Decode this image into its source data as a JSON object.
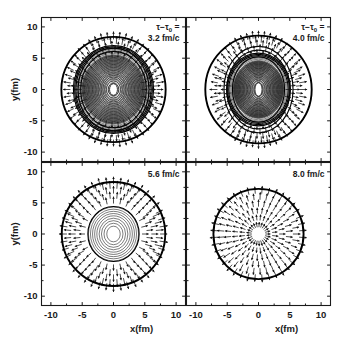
{
  "figure": {
    "width": 347,
    "height": 349,
    "background": "#ffffff",
    "foreground": "#111111"
  },
  "axes": {
    "x_title": "x(fm)",
    "y_title": "y(fm)",
    "x_ticks": [
      "-10",
      "-5",
      "0",
      "5",
      "10"
    ],
    "y_ticks": [
      "10",
      "5",
      "0",
      "-5",
      "-10"
    ],
    "x_tick_values": [
      -10,
      -5,
      0,
      5,
      10
    ],
    "y_tick_values": [
      10,
      5,
      0,
      -5,
      -10
    ],
    "xlim": [
      -11.5,
      11.5
    ],
    "ylim": [
      -11.5,
      11.5
    ],
    "minor_ticks_per_interval": 1
  },
  "panels": [
    {
      "id": "panel-top-left",
      "row": 0,
      "col": 0,
      "time_prefix": "τ−τ",
      "time_prefix_sub": "0",
      "time_prefix_suffix": " =",
      "time_label": "3.2 fm/c",
      "show_time_prefix": true,
      "show_y_axis": true,
      "show_x_axis": true,
      "outer_radius_fm": 8.4,
      "inner_shell_radii_fm": [
        6.6,
        6.1
      ],
      "arrow_ring_radii_fm": [
        5.2,
        5.9,
        6.6,
        7.3,
        8.0
      ],
      "arrow_count": 48,
      "arrow_length_fm": 0.95,
      "contour_count": 26,
      "contour_max_rx_fm": 6.4,
      "contour_max_ry_fm": 7.0,
      "contour_min_rx_fm": 0.42,
      "contour_min_ry_fm": 0.62,
      "core_filled": true,
      "eccentricity": 0.86
    },
    {
      "id": "panel-top-right",
      "row": 0,
      "col": 1,
      "time_prefix": "τ−τ",
      "time_prefix_sub": "0",
      "time_prefix_suffix": " =",
      "time_label": "4.0 fm/c",
      "show_time_prefix": true,
      "show_y_axis": false,
      "show_x_axis": true,
      "outer_radius_fm": 8.6,
      "inner_shell_radii_fm": [
        6.9,
        6.3,
        5.2
      ],
      "arrow_ring_radii_fm": [
        5.4,
        6.1,
        6.8,
        7.5,
        8.2
      ],
      "arrow_count": 48,
      "arrow_length_fm": 0.95,
      "contour_count": 22,
      "contour_max_rx_fm": 5.1,
      "contour_max_ry_fm": 5.8,
      "contour_min_rx_fm": 0.38,
      "contour_min_ry_fm": 0.72,
      "core_filled": true,
      "eccentricity": 0.8
    },
    {
      "id": "panel-bottom-left",
      "row": 1,
      "col": 0,
      "time_prefix": "",
      "time_prefix_sub": "",
      "time_prefix_suffix": "",
      "time_label": "5.6 fm/c",
      "show_time_prefix": false,
      "show_y_axis": true,
      "show_x_axis": true,
      "outer_radius_fm": 8.3,
      "inner_shell_radii_fm": [
        4.4
      ],
      "arrow_ring_radii_fm": [
        4.9,
        5.7,
        6.5,
        7.3,
        8.0
      ],
      "arrow_count": 44,
      "arrow_length_fm": 1.0,
      "contour_count": 9,
      "contour_max_rx_fm": 4.0,
      "contour_max_ry_fm": 4.3,
      "contour_min_rx_fm": 0.5,
      "contour_min_ry_fm": 0.65,
      "core_filled": false,
      "eccentricity": 0.93
    },
    {
      "id": "panel-bottom-right",
      "row": 1,
      "col": 1,
      "time_prefix": "",
      "time_prefix_sub": "",
      "time_prefix_suffix": "",
      "time_label": "8.0 fm/c",
      "show_time_prefix": false,
      "show_y_axis": false,
      "show_x_axis": true,
      "outer_radius_fm": 7.2,
      "inner_shell_radii_fm": [],
      "arrow_ring_radii_fm": [
        1.1,
        2.2,
        3.3,
        4.4,
        5.5,
        6.5
      ],
      "arrow_count": 40,
      "arrow_length_fm": 1.0,
      "contour_count": 0,
      "contour_max_rx_fm": 0,
      "contour_max_ry_fm": 0,
      "contour_min_rx_fm": 0,
      "contour_min_ry_fm": 0,
      "core_filled": false,
      "eccentricity": 1.0
    }
  ],
  "chart_data": {
    "type": "scatter",
    "title": "",
    "xlabel": "x(fm)",
    "ylabel": "y(fm)",
    "xlim": [
      -11.5,
      11.5
    ],
    "ylim": [
      -11.5,
      11.5
    ],
    "grid": false,
    "legend": "none",
    "panel_times": [
      "3.2 fm/c",
      "4.0 fm/c",
      "5.6 fm/c",
      "8.0 fm/c"
    ],
    "time_variable": "τ−τ₀",
    "xtick_labels": [
      "-10",
      "-5",
      "0",
      "5",
      "10"
    ],
    "ytick_labels": [
      "10",
      "5",
      "0",
      "-5",
      "-10"
    ],
    "series": [
      {
        "name": "3.2 fm/c",
        "outer_radius_fm": 8.4,
        "contour_levels": 26,
        "core_eccentricity": 0.86
      },
      {
        "name": "4.0 fm/c",
        "outer_radius_fm": 8.6,
        "contour_levels": 22,
        "core_eccentricity": 0.8
      },
      {
        "name": "5.6 fm/c",
        "outer_radius_fm": 8.3,
        "contour_levels": 9,
        "core_eccentricity": 0.93
      },
      {
        "name": "8.0 fm/c",
        "outer_radius_fm": 7.2,
        "contour_levels": 0,
        "core_eccentricity": 1.0
      }
    ]
  }
}
